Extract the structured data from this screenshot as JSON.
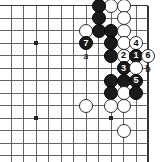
{
  "figure": {
    "kind": "go-board-diagram",
    "width": 160,
    "height": 162,
    "board_color": "#ffffff",
    "line_color": "#555555",
    "border_color": "#333333",
    "black_color": "#1a1a1a",
    "white_color": "#ffffff"
  },
  "grid": {
    "columns_x": [
      11,
      23.5,
      36,
      48.5,
      61,
      73.5,
      86,
      98.5,
      111,
      123.5,
      136,
      148
    ],
    "rows_y": [
      5.5,
      18,
      30.5,
      43,
      55.5,
      68,
      80.5,
      93,
      105.5,
      118,
      130.5,
      143,
      155.5
    ],
    "edge_top": true,
    "edge_right": true,
    "edge_left": false,
    "edge_bottom": false,
    "star_points": [
      {
        "x": 36,
        "y": 43
      },
      {
        "x": 36,
        "y": 118
      },
      {
        "x": 111,
        "y": 118
      }
    ]
  },
  "stones": [
    {
      "id": "w-a1",
      "color": "white",
      "x": 111,
      "y": 5.5,
      "number": ""
    },
    {
      "id": "w-a2",
      "color": "white",
      "x": 123.5,
      "y": 5.5,
      "number": ""
    },
    {
      "id": "b-a3",
      "color": "black",
      "x": 98.5,
      "y": 5.5,
      "number": ""
    },
    {
      "id": "b-b1",
      "color": "black",
      "x": 98.5,
      "y": 18,
      "number": ""
    },
    {
      "id": "w-b2",
      "color": "white",
      "x": 123.5,
      "y": 18,
      "number": ""
    },
    {
      "id": "w-c1",
      "color": "white",
      "x": 86,
      "y": 30.5,
      "number": ""
    },
    {
      "id": "b-c2",
      "color": "black",
      "x": 98.5,
      "y": 30.5,
      "number": ""
    },
    {
      "id": "b-c3",
      "color": "black",
      "x": 111,
      "y": 30.5,
      "number": ""
    },
    {
      "id": "w-c4",
      "color": "white",
      "x": 123.5,
      "y": 30.5,
      "number": ""
    },
    {
      "id": "b-d1",
      "color": "black",
      "x": 86,
      "y": 43,
      "number": "7"
    },
    {
      "id": "b-d2",
      "color": "black",
      "x": 111,
      "y": 43,
      "number": ""
    },
    {
      "id": "w-d3",
      "color": "white",
      "x": 123.5,
      "y": 43,
      "number": ""
    },
    {
      "id": "w-d4",
      "color": "white",
      "x": 136,
      "y": 43,
      "number": "4"
    },
    {
      "id": "b-e1",
      "color": "black",
      "x": 111,
      "y": 55.5,
      "number": ""
    },
    {
      "id": "w-e2",
      "color": "white",
      "x": 123.5,
      "y": 55.5,
      "number": "2"
    },
    {
      "id": "b-e3",
      "color": "black",
      "x": 136,
      "y": 55.5,
      "number": "1"
    },
    {
      "id": "w-e4",
      "color": "white",
      "x": 148,
      "y": 55.5,
      "number": "6"
    },
    {
      "id": "b-f1",
      "color": "black",
      "x": 123.5,
      "y": 68,
      "number": "3"
    },
    {
      "id": "w-f2",
      "color": "white",
      "x": 136,
      "y": 68,
      "number": ""
    },
    {
      "id": "b-g1",
      "color": "black",
      "x": 111,
      "y": 80.5,
      "number": ""
    },
    {
      "id": "b-g2",
      "color": "black",
      "x": 123.5,
      "y": 80.5,
      "number": ""
    },
    {
      "id": "b-g3",
      "color": "black",
      "x": 136,
      "y": 80.5,
      "number": "5"
    },
    {
      "id": "b-h1",
      "color": "black",
      "x": 111,
      "y": 93,
      "number": ""
    },
    {
      "id": "w-h2",
      "color": "white",
      "x": 123.5,
      "y": 93,
      "number": ""
    },
    {
      "id": "b-h3",
      "color": "black",
      "x": 136,
      "y": 93,
      "number": ""
    },
    {
      "id": "w-i1",
      "color": "white",
      "x": 86,
      "y": 105.5,
      "number": ""
    },
    {
      "id": "w-i2",
      "color": "white",
      "x": 111,
      "y": 105.5,
      "number": ""
    },
    {
      "id": "w-i3",
      "color": "white",
      "x": 123.5,
      "y": 105.5,
      "number": ""
    },
    {
      "id": "w-j1",
      "color": "white",
      "x": 123.5,
      "y": 130.5,
      "number": ""
    }
  ],
  "labels": [
    {
      "id": "label-a",
      "text": "a",
      "x": 86,
      "y": 55.5
    },
    {
      "id": "label-b",
      "text": "b",
      "x": 148,
      "y": 68
    }
  ]
}
